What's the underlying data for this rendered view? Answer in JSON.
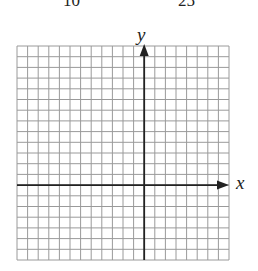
{
  "header": {
    "left_number": "10",
    "right_number": "25"
  },
  "graph": {
    "x_axis_label": "x",
    "y_axis_label": "y",
    "columns": 20,
    "rows": 20,
    "y_axis_column": 12,
    "x_axis_row": 13,
    "grid_color": "#9a9a9a",
    "axis_color": "#222222"
  }
}
